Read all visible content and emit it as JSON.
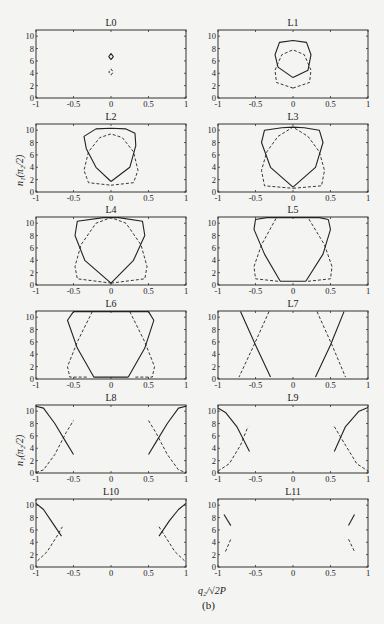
{
  "figure": {
    "caption": "(b)",
    "xlabel": "q₂/√2P",
    "ylabel": "n₁(π₂/2)",
    "ylabel_rows": [
      1,
      4
    ]
  },
  "chart_data": {
    "type": "line",
    "layout": "6 rows x 2 columns of subplots",
    "xlim": [
      -1,
      1
    ],
    "ylim": [
      0,
      11
    ],
    "xticks": [
      -1,
      -0.5,
      0,
      0.5,
      1
    ],
    "xtick_labels": [
      "-1",
      "-0.5",
      "0",
      "0.5",
      "1"
    ],
    "yticks": [
      0,
      2,
      4,
      6,
      8,
      10
    ],
    "ytick_labels": [
      "0",
      "2",
      "4",
      "6",
      "8",
      "10"
    ],
    "xlabel": "q₂/√2P",
    "ylabel": "n₁(π₂/2)",
    "series_styles": [
      {
        "name": "solid",
        "style": "solid"
      },
      {
        "name": "dashed",
        "style": "dashed"
      }
    ],
    "panels": [
      {
        "title": "L0",
        "solid": [
          [
            0,
            6.2
          ],
          [
            0.03,
            6.7
          ],
          [
            0,
            7.2
          ],
          [
            -0.03,
            6.7
          ],
          [
            0,
            6.2
          ]
        ],
        "dashed": [
          [
            0,
            3.7
          ],
          [
            0.03,
            4.2
          ],
          [
            0,
            4.7
          ],
          [
            -0.03,
            4.2
          ],
          [
            0,
            3.7
          ]
        ]
      },
      {
        "title": "L1",
        "solid": [
          [
            0,
            3.3
          ],
          [
            0.2,
            4.5
          ],
          [
            0.24,
            7
          ],
          [
            0.18,
            9
          ],
          [
            0,
            9.3
          ],
          [
            -0.18,
            9
          ],
          [
            -0.24,
            7
          ],
          [
            -0.2,
            5
          ],
          [
            0,
            3.3
          ]
        ],
        "dashed": [
          [
            0,
            1.6
          ],
          [
            0.22,
            2.5
          ],
          [
            0.24,
            4.5
          ],
          [
            0.15,
            7
          ],
          [
            0,
            7.8
          ],
          [
            -0.15,
            7
          ],
          [
            -0.24,
            4.5
          ],
          [
            -0.22,
            2.5
          ],
          [
            0,
            1.6
          ]
        ]
      },
      {
        "title": "L2",
        "solid": [
          [
            0,
            1.7
          ],
          [
            0.25,
            4
          ],
          [
            0.33,
            7.5
          ],
          [
            0.32,
            9.5
          ],
          [
            0.2,
            10.2
          ],
          [
            0,
            10.3
          ],
          [
            -0.2,
            10.2
          ],
          [
            -0.36,
            9
          ],
          [
            -0.33,
            7
          ],
          [
            -0.2,
            4
          ],
          [
            0,
            1.7
          ]
        ],
        "dashed": [
          [
            0,
            1.1
          ],
          [
            0.3,
            1.5
          ],
          [
            0.36,
            3.5
          ],
          [
            0.3,
            6.5
          ],
          [
            0.15,
            8.8
          ],
          [
            0,
            9.4
          ],
          [
            -0.15,
            8.8
          ],
          [
            -0.3,
            6.5
          ],
          [
            -0.36,
            3.5
          ],
          [
            -0.3,
            1.5
          ],
          [
            0,
            1.1
          ]
        ]
      },
      {
        "title": "L3",
        "solid": [
          [
            0,
            0.8
          ],
          [
            0.3,
            4
          ],
          [
            0.4,
            8
          ],
          [
            0.35,
            10
          ],
          [
            0.15,
            10.4
          ],
          [
            0,
            10.5
          ],
          [
            -0.15,
            10.4
          ],
          [
            -0.38,
            10
          ],
          [
            -0.42,
            8
          ],
          [
            -0.3,
            4
          ],
          [
            0,
            0.8
          ]
        ],
        "dashed": [
          [
            0,
            0.6
          ],
          [
            0.38,
            1
          ],
          [
            0.42,
            3.5
          ],
          [
            0.35,
            6.5
          ],
          [
            0.2,
            9
          ],
          [
            0,
            10.5
          ],
          [
            -0.2,
            9
          ],
          [
            -0.35,
            6.5
          ],
          [
            -0.42,
            3.5
          ],
          [
            -0.38,
            1
          ],
          [
            0,
            0.6
          ]
        ]
      },
      {
        "title": "L4",
        "solid": [
          [
            0,
            0.3
          ],
          [
            0.3,
            4
          ],
          [
            0.45,
            8
          ],
          [
            0.42,
            10.3
          ],
          [
            0.1,
            10.9
          ],
          [
            -0.1,
            10.9
          ],
          [
            -0.45,
            10.3
          ],
          [
            -0.48,
            8
          ],
          [
            -0.35,
            4
          ],
          [
            0,
            0.3
          ]
        ],
        "dashed": [
          [
            0,
            0.3
          ],
          [
            0.45,
            1
          ],
          [
            0.48,
            3
          ],
          [
            0.4,
            6.5
          ],
          [
            0.2,
            10
          ],
          [
            0,
            10.9
          ],
          [
            -0.2,
            10
          ],
          [
            -0.4,
            6.5
          ],
          [
            -0.48,
            3
          ],
          [
            -0.45,
            1
          ],
          [
            0,
            0.3
          ]
        ]
      },
      {
        "title": "L5",
        "solid": [
          [
            0.17,
            0.6
          ],
          [
            0.4,
            5
          ],
          [
            0.5,
            9
          ],
          [
            0.47,
            10.6
          ],
          [
            0.35,
            10.9
          ],
          [
            -0.35,
            10.9
          ],
          [
            -0.5,
            10.6
          ],
          [
            -0.52,
            9
          ],
          [
            -0.38,
            5
          ],
          [
            -0.17,
            0.6
          ],
          [
            0.17,
            0.6
          ]
        ],
        "dashed": [
          [
            -0.2,
            0.6
          ],
          [
            -0.5,
            1
          ],
          [
            -0.52,
            3
          ],
          [
            -0.42,
            6.5
          ],
          [
            -0.22,
            10.9
          ]
        ],
        "dashed2": [
          [
            0.2,
            0.6
          ],
          [
            0.5,
            1
          ],
          [
            0.52,
            3
          ],
          [
            0.42,
            6.5
          ],
          [
            0.2,
            10.9
          ]
        ]
      },
      {
        "title": "L6",
        "solid": [
          [
            0.23,
            0.3
          ],
          [
            0.45,
            5
          ],
          [
            0.57,
            9.5
          ],
          [
            0.5,
            10.9
          ],
          [
            -0.5,
            10.9
          ],
          [
            -0.58,
            9.5
          ],
          [
            -0.45,
            5
          ],
          [
            -0.23,
            0.3
          ],
          [
            0.23,
            0.3
          ]
        ],
        "dashed": [
          [
            -0.25,
            10.9
          ],
          [
            -0.45,
            6
          ],
          [
            -0.58,
            2
          ],
          [
            -0.55,
            0.3
          ],
          [
            -0.3,
            0.3
          ]
        ],
        "dashed2": [
          [
            0.25,
            10.9
          ],
          [
            0.45,
            6
          ],
          [
            0.58,
            2
          ],
          [
            0.55,
            0.3
          ],
          [
            0.3,
            0.3
          ]
        ]
      },
      {
        "title": "L7",
        "solid": [
          [
            -0.3,
            0.3
          ],
          [
            -0.5,
            5.5
          ],
          [
            -0.7,
            10.9
          ]
        ],
        "solid2": [
          [
            0.3,
            0.3
          ],
          [
            0.5,
            5.5
          ],
          [
            0.68,
            10.9
          ]
        ],
        "dashed": [
          [
            -0.32,
            10.9
          ],
          [
            -0.52,
            5.5
          ],
          [
            -0.72,
            0.3
          ]
        ],
        "dashed2": [
          [
            0.32,
            10.9
          ],
          [
            0.52,
            5.5
          ],
          [
            0.7,
            0.3
          ]
        ]
      },
      {
        "title": "L8",
        "solid": [
          [
            -1,
            10.8
          ],
          [
            -0.9,
            10.5
          ],
          [
            -0.75,
            8
          ],
          [
            -0.6,
            5
          ],
          [
            -0.5,
            3
          ]
        ],
        "solid2": [
          [
            0.5,
            3
          ],
          [
            0.6,
            5
          ],
          [
            0.75,
            8
          ],
          [
            0.9,
            10.5
          ],
          [
            1,
            10.8
          ]
        ],
        "dashed": [
          [
            -1,
            0.1
          ],
          [
            -0.9,
            0.5
          ],
          [
            -0.75,
            3
          ],
          [
            -0.6,
            6.5
          ],
          [
            -0.5,
            8.5
          ]
        ],
        "dashed2": [
          [
            0.5,
            8.5
          ],
          [
            0.6,
            6.5
          ],
          [
            0.75,
            3
          ],
          [
            0.9,
            0.5
          ],
          [
            1,
            0.1
          ]
        ]
      },
      {
        "title": "L9",
        "solid": [
          [
            -1,
            10.5
          ],
          [
            -0.9,
            9.8
          ],
          [
            -0.75,
            7.5
          ],
          [
            -0.58,
            3.5
          ]
        ],
        "solid2": [
          [
            0.55,
            3.5
          ],
          [
            0.7,
            7.5
          ],
          [
            0.88,
            10
          ],
          [
            1,
            10.6
          ]
        ],
        "dashed": [
          [
            -1,
            0.3
          ],
          [
            -0.85,
            1.5
          ],
          [
            -0.7,
            4.5
          ],
          [
            -0.6,
            7.5
          ]
        ],
        "dashed2": [
          [
            0.55,
            7.5
          ],
          [
            0.7,
            4.5
          ],
          [
            0.85,
            1.5
          ],
          [
            1,
            0.3
          ]
        ]
      },
      {
        "title": "L10",
        "solid": [
          [
            -1,
            10.3
          ],
          [
            -0.9,
            9.3
          ],
          [
            -0.8,
            7.5
          ],
          [
            -0.66,
            5
          ]
        ],
        "solid2": [
          [
            0.64,
            5
          ],
          [
            0.78,
            7.5
          ],
          [
            0.9,
            9.3
          ],
          [
            1,
            10.3
          ]
        ],
        "dashed": [
          [
            -0.98,
            1
          ],
          [
            -0.85,
            2.5
          ],
          [
            -0.72,
            5
          ],
          [
            -0.65,
            6.5
          ]
        ],
        "dashed2": [
          [
            0.64,
            6.5
          ],
          [
            0.72,
            5
          ],
          [
            0.85,
            2.5
          ],
          [
            0.98,
            1
          ]
        ]
      },
      {
        "title": "L11",
        "solid": [
          [
            -0.92,
            8.5
          ],
          [
            -0.83,
            6.7
          ]
        ],
        "solid2": [
          [
            0.74,
            6.7
          ],
          [
            0.82,
            8.5
          ]
        ],
        "dashed": [
          [
            -0.9,
            2.5
          ],
          [
            -0.83,
            4.5
          ]
        ],
        "dashed2": [
          [
            0.74,
            4.5
          ],
          [
            0.82,
            2.5
          ]
        ]
      }
    ]
  }
}
